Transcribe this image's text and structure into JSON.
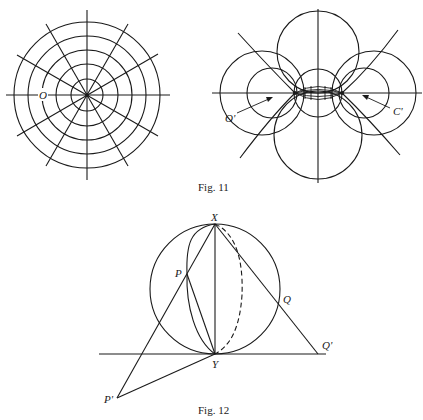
{
  "figures": [
    {
      "caption": "Fig. 11",
      "panels": [
        {
          "name": "polar-grid",
          "labels": {
            "center": "O"
          }
        },
        {
          "name": "coaxal-circles",
          "labels": {
            "left_point": "O'",
            "right_point": "C'"
          }
        }
      ]
    },
    {
      "caption": "Fig. 12",
      "labels": {
        "top": "X",
        "bottom": "Y",
        "p": "P",
        "p_prime": "P'",
        "q": "Q",
        "q_prime": "Q'"
      }
    }
  ]
}
